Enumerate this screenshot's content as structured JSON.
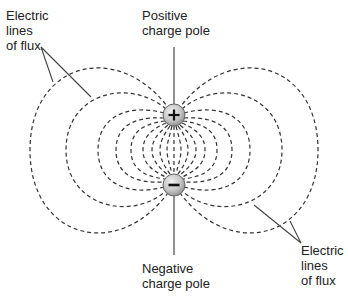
{
  "diagram": {
    "labels": {
      "flux_top_left": [
        "Electric",
        "lines",
        "of flux"
      ],
      "positive_pole": [
        "Positive",
        "charge pole"
      ],
      "negative_pole": [
        "Negative",
        "charge pole"
      ],
      "flux_bottom_right": [
        "Electric",
        "lines",
        "of flux"
      ]
    },
    "poles": [
      {
        "name": "positive",
        "symbol": "+",
        "cx": 174,
        "cy": 115,
        "r": 11
      },
      {
        "name": "negative",
        "symbol": "−",
        "cx": 174,
        "cy": 185,
        "r": 11
      }
    ],
    "colors": {
      "line": "#333333",
      "pole_fill_light": "#e6e6e6",
      "pole_fill_dark": "#9a9a9a",
      "text": "#222222"
    }
  }
}
